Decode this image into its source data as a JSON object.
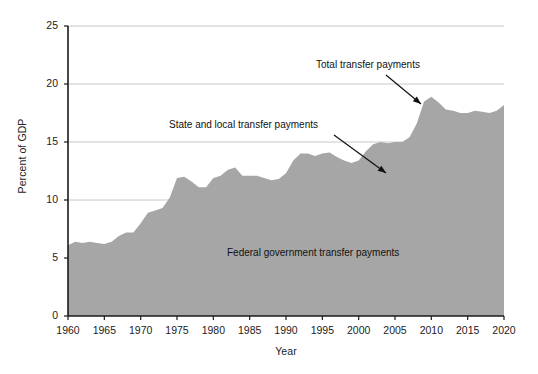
{
  "chart_data": {
    "type": "area",
    "title": "",
    "xlabel": "Year",
    "ylabel": "Percent of GDP",
    "xlim": [
      1960,
      2020
    ],
    "ylim": [
      0,
      25
    ],
    "ytick_labels": [
      "0",
      "5",
      "10",
      "15",
      "20",
      "25"
    ],
    "yticks": [
      0,
      5,
      10,
      15,
      20,
      25
    ],
    "xtick_labels": [
      "1960",
      "1965",
      "1970",
      "1975",
      "1980",
      "1985",
      "1990",
      "1995",
      "2000",
      "2005",
      "2010",
      "2015",
      "2020"
    ],
    "xticks": [
      1960,
      1965,
      1970,
      1975,
      1980,
      1985,
      1990,
      1995,
      2000,
      2005,
      2010,
      2015,
      2020
    ],
    "grid": "horizontal",
    "legend_position": "inline-annotations",
    "fill_color": "#a6a6a6",
    "grid_color": "#c8c8c8",
    "axis_color": "#1a1a1a",
    "series": [
      {
        "name": "Total transfer payments",
        "x": [
          1960,
          1961,
          1962,
          1963,
          1964,
          1965,
          1966,
          1967,
          1968,
          1969,
          1970,
          1971,
          1972,
          1973,
          1974,
          1975,
          1976,
          1977,
          1978,
          1979,
          1980,
          1981,
          1982,
          1983,
          1984,
          1985,
          1986,
          1987,
          1988,
          1989,
          1990,
          1991,
          1992,
          1993,
          1994,
          1995,
          1996,
          1997,
          1998,
          1999,
          2000,
          2001,
          2002,
          2003,
          2004,
          2005,
          2006,
          2007,
          2008,
          2009,
          2010,
          2011,
          2012,
          2013,
          2014,
          2015,
          2016,
          2017,
          2018,
          2019,
          2020
        ],
        "values": [
          6.1,
          6.4,
          6.3,
          6.4,
          6.3,
          6.2,
          6.4,
          6.9,
          7.2,
          7.2,
          8.0,
          8.9,
          9.1,
          9.3,
          10.2,
          11.9,
          12.0,
          11.6,
          11.1,
          11.1,
          11.9,
          12.1,
          12.6,
          12.8,
          12.1,
          12.1,
          12.1,
          11.9,
          11.7,
          11.8,
          12.3,
          13.4,
          14.0,
          14.0,
          13.8,
          14.0,
          14.1,
          13.7,
          13.4,
          13.2,
          13.4,
          14.2,
          14.8,
          15.0,
          14.9,
          15.0,
          15.0,
          15.4,
          16.6,
          18.5,
          18.9,
          18.4,
          17.8,
          17.7,
          17.5,
          17.5,
          17.7,
          17.6,
          17.5,
          17.7,
          18.2
        ]
      }
    ],
    "annotations": [
      {
        "text": "Total transfer payments",
        "text_x": 316,
        "text_y": 59,
        "arrow_from_x": 386,
        "arrow_from_y": 75,
        "arrow_to_x": 421,
        "arrow_to_y": 104
      },
      {
        "text": "State and local transfer payments",
        "text_x": 169,
        "text_y": 119,
        "arrow_from_x": 334,
        "arrow_from_y": 135,
        "arrow_to_x": 386,
        "arrow_to_y": 173
      },
      {
        "text": "Federal government transfer payments",
        "text_x": 227,
        "text_y": 247,
        "arrow_from_x": null,
        "arrow_from_y": null,
        "arrow_to_x": null,
        "arrow_to_y": null
      }
    ]
  }
}
